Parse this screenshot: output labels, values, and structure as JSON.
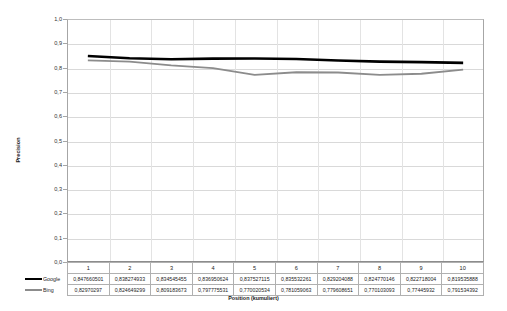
{
  "chart_data": {
    "type": "line",
    "title": "",
    "xlabel": "Position (kumuliert)",
    "ylabel": "Precision",
    "categories": [
      "1",
      "2",
      "3",
      "4",
      "5",
      "6",
      "7",
      "8",
      "9",
      "10"
    ],
    "ylim": [
      0.0,
      1.0
    ],
    "ytick_labels": [
      "1,0",
      "0,9",
      "0,8",
      "0,7",
      "0,6",
      "0,5",
      "0,4",
      "0,3",
      "0,2",
      "0,1",
      "0,0"
    ],
    "ytick_values": [
      1.0,
      0.9,
      0.8,
      0.7,
      0.6,
      0.5,
      0.4,
      0.3,
      0.2,
      0.1,
      0.0
    ],
    "grid": true,
    "legend_position": "table-left",
    "series": [
      {
        "name": "Google",
        "color": "#000000",
        "values": [
          0.847660501,
          0.838274933,
          0.834545455,
          0.836950624,
          0.837527115,
          0.835532261,
          0.829204088,
          0.824770146,
          0.822718004,
          0.819535888
        ],
        "labels": [
          "0,847660501",
          "0,838274933",
          "0,834545455",
          "0,836950624",
          "0,837527115",
          "0,835532261",
          "0,829204088",
          "0,824770146",
          "0,822718004",
          "0,819535888"
        ]
      },
      {
        "name": "Bing",
        "color": "#8c8c8c",
        "values": [
          0.82970297,
          0.824649299,
          0.809183673,
          0.797775531,
          0.770020534,
          0.781059063,
          0.779608651,
          0.770103093,
          0.77445932,
          0.791534392
        ],
        "labels": [
          "0,82970297",
          "0,824649299",
          "0,809183673",
          "0,797775531",
          "0,770020534",
          "0,781059063",
          "0,779608651",
          "0,770103093",
          "0,77445932",
          "0,791534392"
        ]
      }
    ]
  }
}
